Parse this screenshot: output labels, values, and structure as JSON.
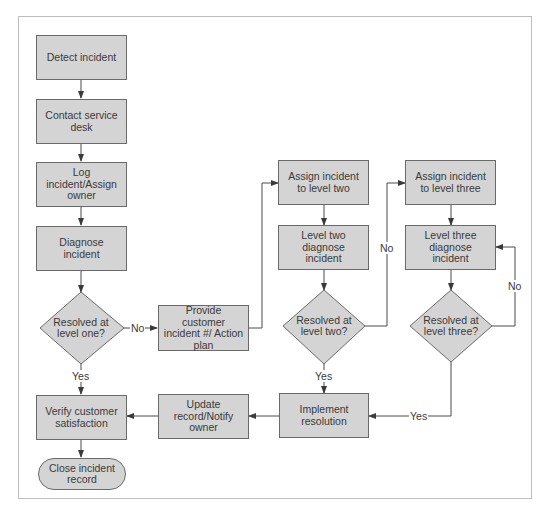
{
  "colors": {
    "box_fill": "#d4d4d4",
    "box_border": "#6a6a6a",
    "line": "#4a4a4a",
    "frame": "#bdbdbd",
    "text": "#3a3a3a"
  },
  "nodes": {
    "detect": "Detect incident",
    "contact": "Contact service desk",
    "log": "Log incident/Assign owner",
    "diagnose": "Diagnose incident",
    "resolved_one": "Resolved at level one?",
    "provide": "Provide customer incident #/ Action plan",
    "assign_two": "Assign incident to level two",
    "diagnose_two": "Level two diagnose incident",
    "resolved_two": "Resolved at level two?",
    "assign_three": "Assign incident to level three",
    "diagnose_three": "Level three diagnose incident",
    "resolved_three": "Resolved at level three?",
    "implement": "Implement resolution",
    "update": "Update record/Notify owner",
    "verify": "Verify customer satisfaction",
    "close": "Close incident record"
  },
  "edge_labels": {
    "one_no": "No",
    "one_yes": "Yes",
    "two_no": "No",
    "two_yes": "Yes",
    "three_no": "No",
    "three_yes": "Yes"
  }
}
